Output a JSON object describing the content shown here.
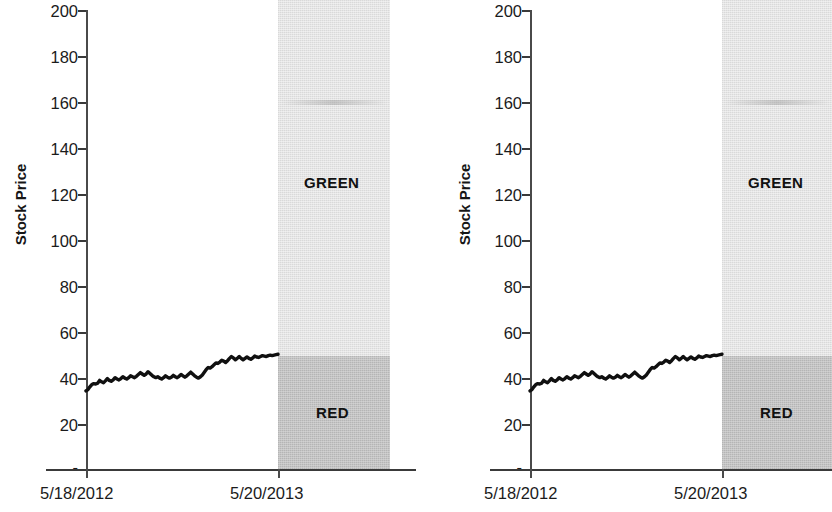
{
  "figure": {
    "panel_count": 2,
    "background": "#ffffff"
  },
  "axis": {
    "ylabel": "Stock Price",
    "yticks": [
      "200",
      "180",
      "160",
      "140",
      "120",
      "100",
      "80",
      "60",
      "40",
      "20",
      "-"
    ],
    "xticks": [
      "5/18/2012",
      "5/20/2013"
    ]
  },
  "zones": {
    "green_label": "GREEN",
    "red_label": "RED",
    "green_color": "#e6e6e6",
    "red_color": "#bdbdbd"
  },
  "chart_data": {
    "type": "line",
    "title": "",
    "xlabel": "",
    "ylabel": "Stock Price",
    "ylim": [
      0,
      200
    ],
    "yticks": [
      0,
      20,
      40,
      60,
      80,
      100,
      120,
      140,
      160,
      180,
      200
    ],
    "ytick_labels": [
      "-",
      "20",
      "40",
      "60",
      "80",
      "100",
      "120",
      "140",
      "160",
      "180",
      "200"
    ],
    "x": [
      "5/18/2012",
      "5/20/2013"
    ],
    "xtick_labels": [
      "5/18/2012",
      "5/20/2013"
    ],
    "grid": false,
    "legend": "none",
    "panels": [
      {
        "name": "left-chart",
        "series": [
          {
            "name": "Stock Price",
            "color": "#101010",
            "values": [
              34.0,
              34.6,
              35.8,
              36.8,
              37.2,
              37.0,
              37.4,
              38.6,
              38.0,
              37.6,
              38.4,
              39.4,
              38.6,
              38.2,
              38.8,
              39.8,
              39.2,
              38.8,
              39.4,
              40.2,
              39.6,
              39.2,
              39.8,
              40.6,
              40.2,
              39.8,
              40.4,
              41.2,
              42.0,
              41.4,
              40.8,
              41.4,
              42.4,
              41.6,
              40.8,
              40.2,
              39.8,
              40.2,
              39.6,
              39.2,
              39.8,
              40.6,
              40.0,
              39.6,
              40.0,
              40.8,
              40.2,
              39.8,
              40.4,
              41.2,
              40.6,
              40.0,
              40.6,
              41.4,
              42.2,
              41.4,
              40.6,
              40.0,
              39.6,
              40.2,
              41.0,
              42.2,
              43.4,
              44.2,
              44.0,
              44.6,
              45.4,
              46.2,
              46.0,
              46.6,
              47.4,
              47.0,
              46.4,
              47.2,
              48.2,
              49.0,
              48.4,
              47.6,
              48.2,
              49.0,
              48.2,
              47.6,
              48.2,
              48.8,
              48.2,
              47.8,
              48.4,
              49.2,
              48.8,
              48.6,
              49.0,
              49.4,
              49.2,
              49.0,
              49.4,
              49.6,
              49.4,
              49.6,
              49.8,
              50.0
            ]
          }
        ],
        "zones": [
          {
            "label": "GREEN",
            "y_range": [
              50,
              200
            ],
            "color": "#e6e6e6"
          },
          {
            "label": "RED",
            "y_range": [
              0,
              50
            ],
            "color": "#bdbdbd"
          }
        ]
      },
      {
        "name": "right-chart",
        "series": [
          {
            "name": "Stock Price",
            "color": "#101010",
            "values": [
              34.0,
              34.6,
              35.8,
              36.8,
              37.2,
              37.0,
              37.4,
              38.6,
              38.0,
              37.6,
              38.4,
              39.4,
              38.6,
              38.2,
              38.8,
              39.8,
              39.2,
              38.8,
              39.4,
              40.2,
              39.6,
              39.2,
              39.8,
              40.6,
              40.2,
              39.8,
              40.4,
              41.2,
              42.0,
              41.4,
              40.8,
              41.4,
              42.4,
              41.6,
              40.8,
              40.2,
              39.8,
              40.2,
              39.6,
              39.2,
              39.8,
              40.6,
              40.0,
              39.6,
              40.0,
              40.8,
              40.2,
              39.8,
              40.4,
              41.2,
              40.6,
              40.0,
              40.6,
              41.4,
              42.2,
              41.4,
              40.6,
              40.0,
              39.6,
              40.2,
              41.0,
              42.2,
              43.4,
              44.2,
              44.0,
              44.6,
              45.4,
              46.2,
              46.0,
              46.6,
              47.4,
              47.0,
              46.4,
              47.2,
              48.2,
              49.0,
              48.4,
              47.6,
              48.2,
              49.0,
              48.2,
              47.6,
              48.2,
              48.8,
              48.2,
              47.8,
              48.4,
              49.2,
              48.8,
              48.6,
              49.0,
              49.4,
              49.2,
              49.0,
              49.4,
              49.6,
              49.4,
              49.6,
              49.8,
              50.0
            ]
          }
        ],
        "zones": [
          {
            "label": "GREEN",
            "y_range": [
              50,
              200
            ],
            "color": "#e6e6e6"
          },
          {
            "label": "RED",
            "y_range": [
              0,
              50
            ],
            "color": "#bdbdbd"
          }
        ]
      }
    ]
  }
}
